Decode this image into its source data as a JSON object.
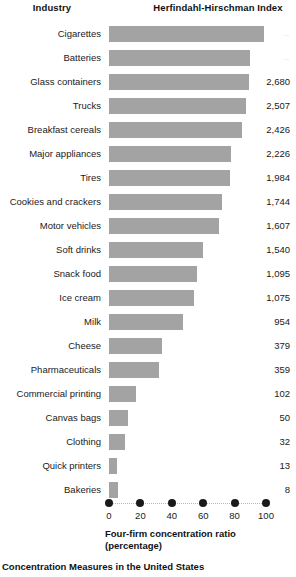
{
  "headers": {
    "industry": "Industry",
    "hhi": "Herfindahl-Hirschman Index"
  },
  "axis_title": {
    "line1": "Four-firm concentration ratio",
    "line2": "(percentage)"
  },
  "caption": "Concentration Measures in the United States",
  "colors": {
    "bar": "#a3a3a3",
    "text": "#1a1a1a",
    "dot": "#1a1a1a",
    "dotted_line": "#b8b8b8",
    "background": "#ffffff"
  },
  "chart_data": {
    "type": "bar",
    "orientation": "horizontal",
    "title": "Concentration Measures in the United States",
    "xlabel": "Four-firm concentration ratio (percentage)",
    "ylabel": "Industry",
    "xlim": [
      0,
      100
    ],
    "xticks": [
      0,
      20,
      40,
      60,
      80,
      100
    ],
    "xtick_labels": [
      "0",
      "20",
      "40",
      "60",
      "80",
      "100"
    ],
    "grid": false,
    "legend": "none",
    "value_column_header": "Herfindahl-Hirschman Index",
    "categories": [
      "Cigarettes",
      "Batteries",
      "Glass containers",
      "Trucks",
      "Breakfast cereals",
      "Major appliances",
      "Tires",
      "Cookies and crackers",
      "Motor vehicles",
      "Soft drinks",
      "Snack food",
      "Ice cream",
      "Milk",
      "Cheese",
      "Pharmaceuticals",
      "Commercial printing",
      "Canvas bags",
      "Clothing",
      "Quick printers",
      "Bakeries"
    ],
    "values": [
      99,
      90,
      89,
      87,
      85,
      78,
      77,
      72,
      70,
      60,
      56,
      54,
      47,
      34,
      32,
      17,
      12,
      10,
      5,
      6
    ],
    "hhi": [
      "..",
      "..",
      "2,680",
      "2,507",
      "2,426",
      "2,226",
      "1,984",
      "1,744",
      "1,607",
      "1,540",
      "1,095",
      "1,075",
      "954",
      "379",
      "359",
      "102",
      "50",
      "32",
      "13",
      "8"
    ],
    "rows": [
      {
        "industry": "Cigarettes",
        "ratio": 99,
        "hhi": ".."
      },
      {
        "industry": "Batteries",
        "ratio": 90,
        "hhi": ".."
      },
      {
        "industry": "Glass containers",
        "ratio": 89,
        "hhi": "2,680"
      },
      {
        "industry": "Trucks",
        "ratio": 87,
        "hhi": "2,507"
      },
      {
        "industry": "Breakfast cereals",
        "ratio": 85,
        "hhi": "2,426"
      },
      {
        "industry": "Major appliances",
        "ratio": 78,
        "hhi": "2,226"
      },
      {
        "industry": "Tires",
        "ratio": 77,
        "hhi": "1,984"
      },
      {
        "industry": "Cookies and crackers",
        "ratio": 72,
        "hhi": "1,744"
      },
      {
        "industry": "Motor vehicles",
        "ratio": 70,
        "hhi": "1,607"
      },
      {
        "industry": "Soft drinks",
        "ratio": 60,
        "hhi": "1,540"
      },
      {
        "industry": "Snack food",
        "ratio": 56,
        "hhi": "1,095"
      },
      {
        "industry": "Ice cream",
        "ratio": 54,
        "hhi": "1,075"
      },
      {
        "industry": "Milk",
        "ratio": 47,
        "hhi": "954"
      },
      {
        "industry": "Cheese",
        "ratio": 34,
        "hhi": "379"
      },
      {
        "industry": "Pharmaceuticals",
        "ratio": 32,
        "hhi": "359"
      },
      {
        "industry": "Commercial printing",
        "ratio": 17,
        "hhi": "102"
      },
      {
        "industry": "Canvas bags",
        "ratio": 12,
        "hhi": "50"
      },
      {
        "industry": "Clothing",
        "ratio": 10,
        "hhi": "32"
      },
      {
        "industry": "Quick printers",
        "ratio": 5,
        "hhi": "13"
      },
      {
        "industry": "Bakeries",
        "ratio": 6,
        "hhi": "8"
      }
    ]
  }
}
